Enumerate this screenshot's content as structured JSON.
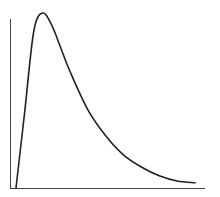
{
  "chart_data": {
    "type": "line",
    "title": "",
    "xlabel": "",
    "ylabel": "",
    "grid": false,
    "legend": null,
    "x": [
      0,
      0.5,
      1,
      1.5,
      2,
      2.5,
      3,
      4,
      5,
      6,
      7,
      8,
      9,
      10
    ],
    "series": [
      {
        "name": "density",
        "values": [
          0.0,
          0.45,
          0.9,
          1.0,
          0.93,
          0.8,
          0.67,
          0.45,
          0.3,
          0.19,
          0.12,
          0.07,
          0.04,
          0.03
        ]
      }
    ],
    "colors": {
      "line": "#222222",
      "axis": "#444444",
      "background": "#ffffff"
    }
  }
}
